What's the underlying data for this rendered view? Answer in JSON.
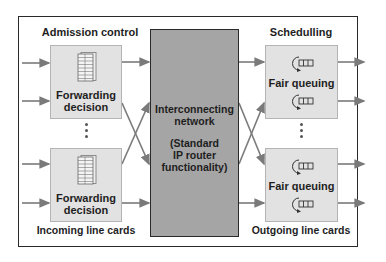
{
  "diagram": {
    "left": {
      "title": "Admission control",
      "footer": "Incoming line cards",
      "cards": [
        {
          "line1": "Forwarding",
          "line2": "decision",
          "icon": "table-stack-icon"
        },
        {
          "line1": "Forwarding",
          "line2": "decision",
          "icon": "table-stack-icon"
        }
      ]
    },
    "center": {
      "line1": "Interconnecting",
      "line2": "network",
      "line3": "(Standard",
      "line4": "IP router",
      "line5": "functionality)"
    },
    "right": {
      "title": "Schedulling",
      "footer": "Outgoing line cards",
      "cards": [
        {
          "label": "Fair queuing",
          "icon": "round-robin-queue-icon"
        },
        {
          "label": "Fair queuing",
          "icon": "round-robin-queue-icon"
        }
      ]
    },
    "colors": {
      "card_fill": "#e2e2e2",
      "center_fill": "#a5a5a5",
      "arrow": "#7a7a7a",
      "border": "#2a2a2a"
    }
  }
}
